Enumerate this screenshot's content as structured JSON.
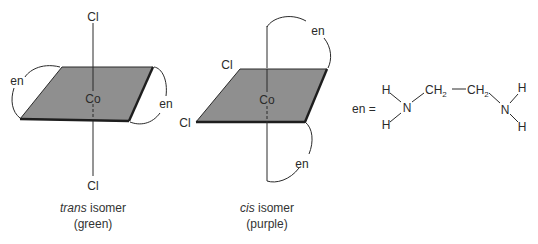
{
  "figure": {
    "trans": {
      "metal": "Co",
      "ligand_top": "Cl",
      "ligand_bottom": "Cl",
      "chelate_left": "en",
      "chelate_right": "en",
      "caption_italic": "trans",
      "caption_rest": " isomer",
      "caption_color": "(green)"
    },
    "cis": {
      "metal": "Co",
      "ligand_cl_upper": "Cl",
      "ligand_cl_left": "Cl",
      "chelate_top": "en",
      "chelate_bottom": "en",
      "caption_italic": "cis",
      "caption_rest": " isomer",
      "caption_color": "(purple)"
    },
    "en_formula": {
      "label": "en =",
      "h1": "H",
      "h2": "H",
      "n1": "N",
      "ch2_a": "CH",
      "ch2_a_sub": "2",
      "ch2_b": "CH",
      "ch2_b_sub": "2",
      "n2": "N",
      "h3": "H",
      "h4": "H"
    },
    "colors": {
      "plane_fill": "#8f8f8f",
      "line": "#2a2a2a",
      "background": "#ffffff"
    }
  }
}
